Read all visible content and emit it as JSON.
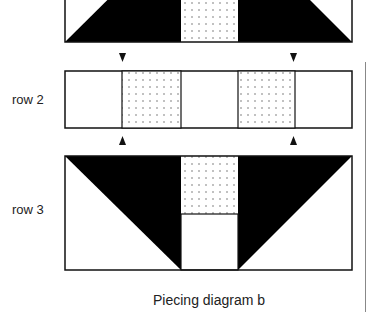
{
  "diagram": {
    "title": "Piecing diagram b",
    "rows": [
      {
        "label": "",
        "name": "row 1",
        "pattern": "white corner triangles top, black trapezoid, dotted center square top"
      },
      {
        "label": "row 2",
        "pattern": "white, dotted, white, dotted, white"
      },
      {
        "label": "row 3",
        "pattern": "white corner triangles bottom, black inverted trapezoid, dotted center square top, white square bottom"
      }
    ],
    "arrows": {
      "down": [
        "arrow above row 2 left",
        "arrow above row 2 right"
      ],
      "up": [
        "arrow below row 2 left",
        "arrow below row 2 right"
      ]
    },
    "colors": {
      "dark": "#000000",
      "light": "#ffffff",
      "dots": "#555555",
      "outline": "#111111"
    }
  }
}
